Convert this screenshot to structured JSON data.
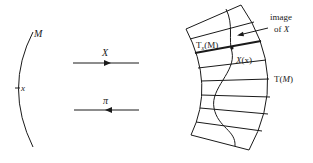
{
  "diagram": {
    "manifold": {
      "label": "M",
      "point_label": "x"
    },
    "arrows": {
      "vector_field": {
        "label": "X",
        "direction": "right"
      },
      "projection": {
        "label": "π",
        "direction": "left"
      }
    },
    "tangent_bundle": {
      "label_prefix": "T",
      "label_arg": "(M)",
      "label_M": "M",
      "fiber_label_T": "T",
      "fiber_label_sub": "x",
      "fiber_label_arg": "(M)",
      "vector_label_X": "X",
      "vector_label_arg": "(x)",
      "image_caption_line1": "image",
      "image_caption_line2_prefix": "of",
      "image_caption_line2_var": "X",
      "fiber_count": 9
    },
    "colors": {
      "ink": "#1a1a1a",
      "background": "#ffffff"
    }
  }
}
